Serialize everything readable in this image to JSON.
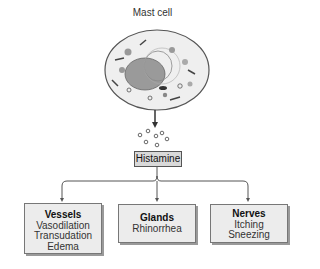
{
  "title": "Mast cell",
  "mediator": "Histamine",
  "targets": [
    {
      "heading": "Vessels",
      "effects": [
        "Vasodilation",
        "Transudation",
        "Edema"
      ]
    },
    {
      "heading": "Glands",
      "effects": [
        "Rhinorrhea"
      ]
    },
    {
      "heading": "Nerves",
      "effects": [
        "Itching",
        "Sneezing"
      ]
    }
  ]
}
